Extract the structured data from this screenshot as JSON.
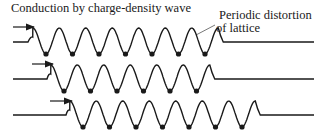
{
  "title": "Conduction by charge-density wave",
  "annotation": {
    "line1": "Periodic distortion",
    "line2": "of lattice"
  },
  "colors": {
    "stroke": "#1a1a1a",
    "background": "#ffffff"
  },
  "rows": [
    {
      "label": "wave-row-1",
      "baseline_y": 42,
      "arrow_x1": 13,
      "arrow_x2": 34,
      "arrow_y": 27,
      "lead_end": 28,
      "first_trough": 46,
      "troughs": 7,
      "tail_end": 314
    },
    {
      "label": "wave-row-2",
      "baseline_y": 79,
      "arrow_x1": 32,
      "arrow_x2": 53,
      "arrow_y": 64,
      "lead_end": 47,
      "first_trough": 64,
      "troughs": 6,
      "tail_end": 314
    },
    {
      "label": "wave-row-3",
      "baseline_y": 115,
      "arrow_x1": 50,
      "arrow_x2": 72,
      "arrow_y": 101,
      "lead_end": 66,
      "first_trough": 83,
      "troughs": 7,
      "tail_end": 314
    }
  ]
}
